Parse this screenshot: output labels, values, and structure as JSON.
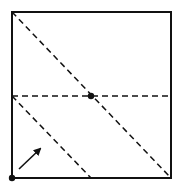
{
  "diagram": {
    "type": "origami-fold",
    "square": {
      "x": 12,
      "y": 12,
      "size": 159,
      "stroke": "#111111"
    },
    "fold_lines": [
      {
        "name": "diagonal-fold",
        "x1": 12,
        "y1": 12,
        "x2": 171,
        "y2": 178
      },
      {
        "name": "horizontal-midline-fold",
        "x1": 12,
        "y1": 96,
        "x2": 171,
        "y2": 96
      },
      {
        "name": "lower-diagonal-fold",
        "x1": 12,
        "y1": 96,
        "x2": 91,
        "y2": 178
      }
    ],
    "points": [
      {
        "name": "center-point",
        "x": 91,
        "y": 96
      },
      {
        "name": "corner-point",
        "x": 12,
        "y": 178
      }
    ],
    "arrow": {
      "x1": 18,
      "y1": 170,
      "x2": 41,
      "y2": 148,
      "meaning": "fold corner up"
    }
  }
}
